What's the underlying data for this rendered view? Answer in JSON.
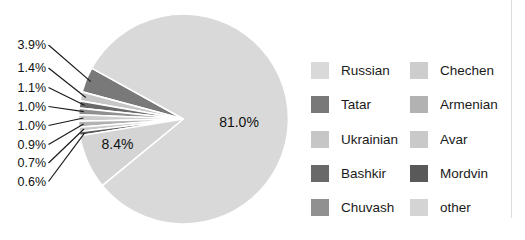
{
  "chart_data": {
    "type": "pie",
    "title": "",
    "legend_position": "right",
    "direction": "counterclockwise",
    "start_angle_deg": 151,
    "series": [
      {
        "label": "Tatar",
        "value": 3.9,
        "pct_label": "3.9%",
        "color": "#797979"
      },
      {
        "label": "Ukrainian",
        "value": 1.4,
        "pct_label": "1.4%",
        "color": "#c6c6c6"
      },
      {
        "label": "Bashkir",
        "value": 1.1,
        "pct_label": "1.1%",
        "color": "#696969"
      },
      {
        "label": "Chuvash",
        "value": 1.0,
        "pct_label": "1.0%",
        "color": "#909090"
      },
      {
        "label": "Chechen",
        "value": 1.0,
        "pct_label": "1.0%",
        "color": "#cdcdcd"
      },
      {
        "label": "Armenian",
        "value": 0.9,
        "pct_label": "0.9%",
        "color": "#b2b2b2"
      },
      {
        "label": "Avar",
        "value": 0.7,
        "pct_label": "0.7%",
        "color": "#c9c9c9"
      },
      {
        "label": "Mordvin",
        "value": 0.6,
        "pct_label": "0.6%",
        "color": "#595959"
      },
      {
        "label": "other",
        "value": 8.4,
        "pct_label": "8.4%",
        "color": "#d4d4d4",
        "label_inside": true
      },
      {
        "label": "Russian",
        "value": 81.0,
        "pct_label": "81.0%",
        "color": "#d9d9d9",
        "label_inside": true
      }
    ],
    "legend_entries": [
      "Russian",
      "Tatar",
      "Ukrainian",
      "Bashkir",
      "Chuvash",
      "Chechen",
      "Armenian",
      "Avar",
      "Mordvin",
      "other"
    ]
  }
}
